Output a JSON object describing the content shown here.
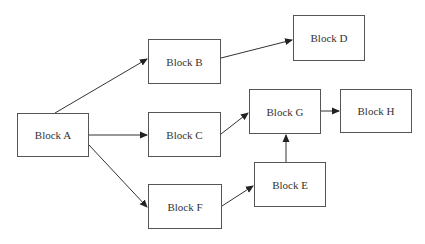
{
  "diagram": {
    "type": "flow",
    "colors": {
      "line": "#333333",
      "border": "#555555",
      "text": "#333333",
      "background": "#ffffff"
    },
    "nodes": [
      {
        "id": "A",
        "label": "Block A",
        "x": 17,
        "y": 113,
        "w": 72,
        "h": 44
      },
      {
        "id": "B",
        "label": "Block B",
        "x": 148,
        "y": 39,
        "w": 73,
        "h": 45
      },
      {
        "id": "C",
        "label": "Block C",
        "x": 148,
        "y": 112,
        "w": 73,
        "h": 45
      },
      {
        "id": "F",
        "label": "Block F",
        "x": 148,
        "y": 184,
        "w": 74,
        "h": 45
      },
      {
        "id": "D",
        "label": "Block D",
        "x": 293,
        "y": 15,
        "w": 72,
        "h": 46
      },
      {
        "id": "G",
        "label": "Block G",
        "x": 249,
        "y": 89,
        "w": 72,
        "h": 45
      },
      {
        "id": "H",
        "label": "Block H",
        "x": 340,
        "y": 89,
        "w": 72,
        "h": 44
      },
      {
        "id": "E",
        "label": "Block E",
        "x": 254,
        "y": 162,
        "w": 72,
        "h": 45
      }
    ],
    "edges": [
      {
        "from": "A",
        "to": "B",
        "x1": 55,
        "y1": 113,
        "x2": 147,
        "y2": 59
      },
      {
        "from": "B",
        "to": "D",
        "x1": 221,
        "y1": 58,
        "x2": 292,
        "y2": 40
      },
      {
        "from": "A",
        "to": "C",
        "x1": 89,
        "y1": 135,
        "x2": 147,
        "y2": 135
      },
      {
        "from": "A",
        "to": "F",
        "x1": 89,
        "y1": 145,
        "x2": 147,
        "y2": 207
      },
      {
        "from": "C",
        "to": "G",
        "x1": 221,
        "y1": 134,
        "x2": 248,
        "y2": 113
      },
      {
        "from": "G",
        "to": "H",
        "x1": 321,
        "y1": 111,
        "x2": 339,
        "y2": 111
      },
      {
        "from": "F",
        "to": "E",
        "x1": 222,
        "y1": 206,
        "x2": 253,
        "y2": 186
      },
      {
        "from": "E",
        "to": "G",
        "x1": 286,
        "y1": 162,
        "x2": 286,
        "y2": 135
      }
    ]
  }
}
